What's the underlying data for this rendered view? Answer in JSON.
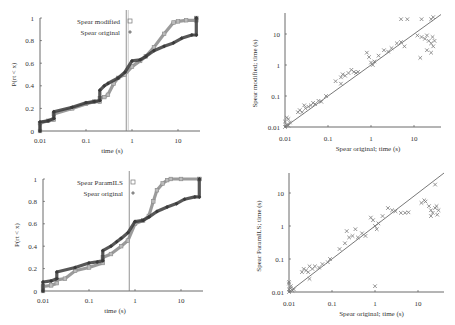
{
  "colors": {
    "modified": "#8a8a8a",
    "original": "#3a3a3a",
    "axis": "#444444",
    "diagonal": "#555555",
    "vline": "#777777",
    "scatter": "#7a7a7a"
  },
  "chart_data": [
    {
      "id": "cdf-top",
      "type": "line",
      "title": "",
      "xlabel": "time (s)",
      "ylabel": "P(rt < x)",
      "xscale": "log",
      "xlim": [
        0.01,
        30
      ],
      "ylim": [
        0,
        1
      ],
      "xticks": [
        "0.01",
        "0.1",
        "1",
        "10"
      ],
      "yticks": [
        "0",
        "0.2",
        "0.4",
        "0.6",
        "0.8",
        "1"
      ],
      "vline_x": 0.75,
      "legend": [
        {
          "label": "Spear modified",
          "marker": "square"
        },
        {
          "label": "Spear original",
          "marker": "diamond"
        }
      ],
      "series": [
        {
          "name": "Spear modified",
          "x": [
            0.01,
            0.01,
            0.015,
            0.02,
            0.02,
            0.05,
            0.1,
            0.15,
            0.2,
            0.2,
            0.25,
            0.3,
            0.4,
            0.5,
            0.7,
            1.0,
            1.5,
            2.0,
            3.0,
            5.0,
            8.0,
            10,
            15,
            25,
            25
          ],
          "y": [
            0.0,
            0.07,
            0.09,
            0.1,
            0.15,
            0.2,
            0.24,
            0.26,
            0.26,
            0.29,
            0.3,
            0.32,
            0.42,
            0.47,
            0.5,
            0.57,
            0.62,
            0.66,
            0.74,
            0.86,
            0.96,
            0.97,
            0.98,
            0.98,
            1.0
          ]
        },
        {
          "name": "Spear original",
          "x": [
            0.01,
            0.01,
            0.015,
            0.02,
            0.02,
            0.05,
            0.1,
            0.15,
            0.2,
            0.2,
            0.25,
            0.3,
            0.5,
            0.7,
            1.0,
            1.5,
            2.0,
            3.0,
            5.0,
            8.0,
            12,
            20,
            25,
            25
          ],
          "y": [
            0.0,
            0.08,
            0.09,
            0.11,
            0.17,
            0.21,
            0.25,
            0.26,
            0.27,
            0.36,
            0.4,
            0.42,
            0.47,
            0.52,
            0.62,
            0.63,
            0.66,
            0.71,
            0.75,
            0.78,
            0.82,
            0.85,
            0.85,
            1.0
          ]
        }
      ]
    },
    {
      "id": "scatter-top",
      "type": "scatter",
      "xlabel": "Spear original; time (s)",
      "ylabel": "Spear modified; time (s)",
      "xscale": "log",
      "yscale": "log",
      "xlim": [
        0.01,
        35
      ],
      "ylim": [
        0.01,
        35
      ],
      "xticks": [
        "0.01",
        "0.1",
        "1",
        "10"
      ],
      "yticks": [
        "0.01",
        "0.1",
        "1",
        "10"
      ],
      "diagonal": true,
      "points": [
        [
          0.01,
          0.01
        ],
        [
          0.011,
          0.012
        ],
        [
          0.012,
          0.011
        ],
        [
          0.01,
          0.015
        ],
        [
          0.011,
          0.02
        ],
        [
          0.013,
          0.014
        ],
        [
          0.012,
          0.018
        ],
        [
          0.02,
          0.03
        ],
        [
          0.022,
          0.035
        ],
        [
          0.025,
          0.03
        ],
        [
          0.03,
          0.04
        ],
        [
          0.028,
          0.05
        ],
        [
          0.035,
          0.045
        ],
        [
          0.04,
          0.05
        ],
        [
          0.045,
          0.06
        ],
        [
          0.05,
          0.055
        ],
        [
          0.06,
          0.07
        ],
        [
          0.07,
          0.065
        ],
        [
          0.09,
          0.1
        ],
        [
          0.15,
          0.3
        ],
        [
          0.2,
          0.4
        ],
        [
          0.22,
          0.5
        ],
        [
          0.25,
          0.45
        ],
        [
          0.3,
          0.55
        ],
        [
          0.35,
          0.7
        ],
        [
          0.4,
          0.6
        ],
        [
          0.45,
          0.55
        ],
        [
          0.5,
          0.6
        ],
        [
          0.2,
          0.25
        ],
        [
          0.8,
          2.5
        ],
        [
          0.9,
          1.8
        ],
        [
          1.0,
          1.2
        ],
        [
          1.1,
          1.0
        ],
        [
          1.2,
          1.3
        ],
        [
          1.5,
          2.0
        ],
        [
          2.0,
          3.0
        ],
        [
          2.5,
          2.7
        ],
        [
          3.0,
          3.5
        ],
        [
          4.0,
          5.0
        ],
        [
          5.0,
          5.5
        ],
        [
          6.0,
          4.0
        ],
        [
          5.0,
          30
        ],
        [
          7.0,
          30
        ],
        [
          15,
          30
        ],
        [
          25,
          30
        ],
        [
          28,
          35
        ],
        [
          15,
          8
        ],
        [
          18,
          7
        ],
        [
          20,
          9
        ],
        [
          22,
          6
        ],
        [
          25,
          5
        ],
        [
          27,
          8
        ],
        [
          28,
          4
        ],
        [
          30,
          6
        ],
        [
          20,
          3
        ],
        [
          14,
          1.7
        ],
        [
          25,
          2.5
        ],
        [
          12,
          9
        ]
      ]
    },
    {
      "id": "cdf-bottom",
      "type": "line",
      "title": "",
      "xlabel": "time (s)",
      "ylabel": "P(rt < x)",
      "xscale": "log",
      "xlim": [
        0.01,
        30
      ],
      "ylim": [
        0,
        1
      ],
      "xticks": [
        "0.01",
        "0.1",
        "1",
        "10"
      ],
      "yticks": [
        "0",
        "0.2",
        "0.4",
        "0.6",
        "0.8",
        "1"
      ],
      "vline_x": 0.75,
      "legend": [
        {
          "label": "Spear ParamILS",
          "marker": "square"
        },
        {
          "label": "Spear original",
          "marker": "diamond"
        }
      ],
      "series": [
        {
          "name": "Spear ParamILS",
          "x": [
            0.01,
            0.01,
            0.015,
            0.02,
            0.02,
            0.03,
            0.05,
            0.1,
            0.2,
            0.2,
            0.3,
            0.5,
            0.7,
            1.0,
            1.5,
            2.0,
            2.5,
            3.0,
            4.0,
            5.0,
            6.0,
            10,
            25,
            25
          ],
          "y": [
            0.0,
            0.04,
            0.05,
            0.07,
            0.1,
            0.11,
            0.18,
            0.21,
            0.25,
            0.3,
            0.33,
            0.4,
            0.45,
            0.6,
            0.63,
            0.67,
            0.8,
            0.9,
            0.96,
            0.99,
            1.0,
            1.0,
            1.0,
            1.0
          ]
        },
        {
          "name": "Spear original",
          "x": [
            0.01,
            0.01,
            0.015,
            0.02,
            0.02,
            0.05,
            0.1,
            0.15,
            0.2,
            0.2,
            0.3,
            0.4,
            0.5,
            0.7,
            1.0,
            1.5,
            2.0,
            3.0,
            5.0,
            8.0,
            12,
            20,
            25,
            25
          ],
          "y": [
            0.0,
            0.08,
            0.09,
            0.11,
            0.17,
            0.21,
            0.25,
            0.26,
            0.27,
            0.36,
            0.4,
            0.44,
            0.47,
            0.52,
            0.62,
            0.63,
            0.66,
            0.71,
            0.75,
            0.78,
            0.82,
            0.84,
            0.84,
            1.0
          ]
        }
      ]
    },
    {
      "id": "scatter-bottom",
      "type": "scatter",
      "xlabel": "Spear original; time (s)",
      "ylabel": "Spear ParamILS; time (s)",
      "xscale": "log",
      "yscale": "log",
      "xlim": [
        0.01,
        35
      ],
      "ylim": [
        0.01,
        35
      ],
      "xticks": [
        "0.01",
        "0.1",
        "1",
        "10"
      ],
      "yticks": [
        "0.01",
        "0.1",
        "1",
        "10"
      ],
      "diagonal": true,
      "points": [
        [
          0.01,
          0.01
        ],
        [
          0.01,
          0.012
        ],
        [
          0.011,
          0.015
        ],
        [
          0.01,
          0.02
        ],
        [
          0.012,
          0.011
        ],
        [
          0.011,
          0.013
        ],
        [
          0.013,
          0.012
        ],
        [
          0.01,
          0.018
        ],
        [
          0.02,
          0.04
        ],
        [
          0.022,
          0.05
        ],
        [
          0.025,
          0.045
        ],
        [
          0.03,
          0.06
        ],
        [
          0.028,
          0.04
        ],
        [
          0.035,
          0.05
        ],
        [
          0.04,
          0.06
        ],
        [
          0.05,
          0.055
        ],
        [
          0.06,
          0.07
        ],
        [
          0.08,
          0.08
        ],
        [
          0.09,
          0.1
        ],
        [
          0.03,
          0.025
        ],
        [
          0.15,
          0.2
        ],
        [
          0.2,
          0.3
        ],
        [
          0.22,
          0.7
        ],
        [
          0.25,
          0.45
        ],
        [
          0.3,
          0.5
        ],
        [
          0.35,
          0.8
        ],
        [
          0.4,
          0.45
        ],
        [
          0.5,
          0.6
        ],
        [
          0.6,
          0.5
        ],
        [
          0.8,
          1.8
        ],
        [
          0.9,
          1.5
        ],
        [
          1.0,
          1.0
        ],
        [
          1.1,
          0.8
        ],
        [
          1.2,
          1.2
        ],
        [
          1.5,
          2.0
        ],
        [
          2.0,
          3.5
        ],
        [
          2.5,
          3.0
        ],
        [
          3.0,
          2.8
        ],
        [
          4.0,
          2.5
        ],
        [
          5.0,
          2.5
        ],
        [
          6.0,
          2.6
        ],
        [
          1.0,
          0.015
        ],
        [
          12,
          5
        ],
        [
          14,
          6
        ],
        [
          15,
          5.5
        ],
        [
          18,
          4
        ],
        [
          20,
          3
        ],
        [
          22,
          2.5
        ],
        [
          25,
          3.5
        ],
        [
          27,
          4
        ],
        [
          28,
          2.2
        ],
        [
          30,
          3
        ],
        [
          20,
          2
        ],
        [
          25,
          18
        ]
      ]
    }
  ],
  "caption": ""
}
